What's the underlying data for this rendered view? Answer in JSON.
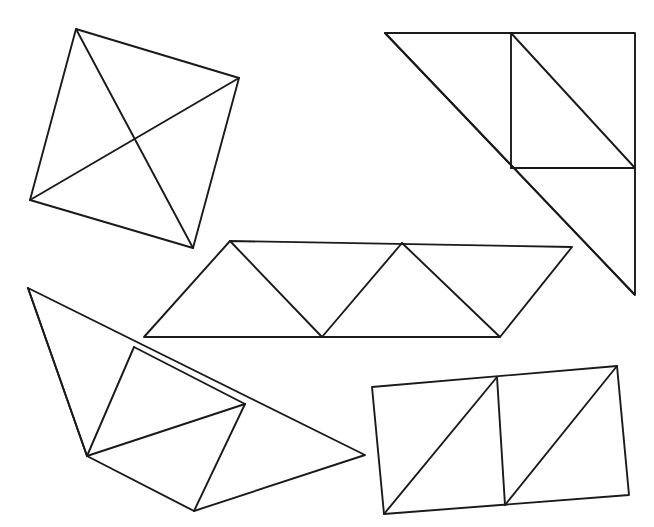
{
  "page": {
    "background_color": "#ffffff",
    "stroke_color": "#1a1a1a",
    "width": 654,
    "height": 527
  },
  "figures": [
    {
      "id": "quadrilateral-with-both-diagonals",
      "name": "Quadrilateral with both diagonals",
      "label": "Figure 1 — top left",
      "vertices": [
        [
          76,
          29
        ],
        [
          239,
          78
        ],
        [
          193,
          248
        ],
        [
          30,
          200
        ]
      ],
      "closed": true,
      "internal_segments": [
        [
          [
            76,
            29
          ],
          [
            193,
            248
          ]
        ],
        [
          [
            239,
            78
          ],
          [
            30,
            200
          ]
        ]
      ],
      "triangle_count": 4
    },
    {
      "id": "right-trapezoid-with-square-and-diagonals",
      "name": "Right trapezoid divided by a square and two diagonals",
      "label": "Figure 2 — top right",
      "vertices": [
        [
          385,
          33
        ],
        [
          635,
          33
        ],
        [
          635,
          295
        ],
        [
          385,
          33
        ]
      ],
      "closed": true,
      "internal_segments": [
        [
          [
            385,
            33
          ],
          [
            634,
            294
          ]
        ],
        [
          [
            511,
            33
          ],
          [
            511,
            168
          ]
        ],
        [
          [
            511,
            168
          ],
          [
            635,
            168
          ]
        ],
        [
          [
            511,
            33
          ],
          [
            635,
            168
          ]
        ]
      ],
      "triangle_count": 4
    },
    {
      "id": "parallelogram-strip-four-triangles",
      "name": "Parallelogram strip divided into four triangles",
      "label": "Figure 3 — middle",
      "vertices": [
        [
          230,
          241
        ],
        [
          572,
          247
        ],
        [
          500,
          337
        ],
        [
          144,
          337
        ]
      ],
      "closed": true,
      "internal_segments": [
        [
          [
            230,
            241
          ],
          [
            322,
            337
          ]
        ],
        [
          [
            322,
            337
          ],
          [
            402,
            243
          ]
        ],
        [
          [
            402,
            243
          ],
          [
            500,
            337
          ]
        ]
      ],
      "triangle_count": 4
    },
    {
      "id": "irregular-quadrilateral-with-interior-triangles",
      "name": "Irregular quadrilateral divided into triangles",
      "label": "Figure 4 — bottom left",
      "vertices": [
        [
          28,
          288
        ],
        [
          365,
          455
        ],
        [
          194,
          511
        ],
        [
          87,
          456
        ]
      ],
      "closed": true,
      "internal_segments": [
        [
          [
            28,
            288
          ],
          [
            87,
            456
          ]
        ],
        [
          [
            87,
            456
          ],
          [
            134,
            347
          ]
        ],
        [
          [
            134,
            347
          ],
          [
            245,
            404
          ]
        ],
        [
          [
            245,
            404
          ],
          [
            87,
            456
          ]
        ],
        [
          [
            245,
            404
          ],
          [
            194,
            511
          ]
        ]
      ],
      "triangle_count": 4
    },
    {
      "id": "rectangle-two-squares-with-diagonals",
      "name": "Tilted rectangle split into two squares each with a diagonal",
      "label": "Figure 5 — bottom right",
      "vertices": [
        [
          372,
          387
        ],
        [
          617,
          366
        ],
        [
          629,
          495
        ],
        [
          384,
          514
        ]
      ],
      "closed": true,
      "internal_segments": [
        [
          [
            497,
            377
          ],
          [
            505,
            505
          ]
        ],
        [
          [
            384,
            514
          ],
          [
            497,
            377
          ]
        ],
        [
          [
            505,
            505
          ],
          [
            617,
            366
          ]
        ]
      ],
      "triangle_count": 4
    }
  ],
  "summary": {
    "figure_count": 5,
    "line_style": "thin black hand-drawn outline",
    "fill": "none"
  }
}
